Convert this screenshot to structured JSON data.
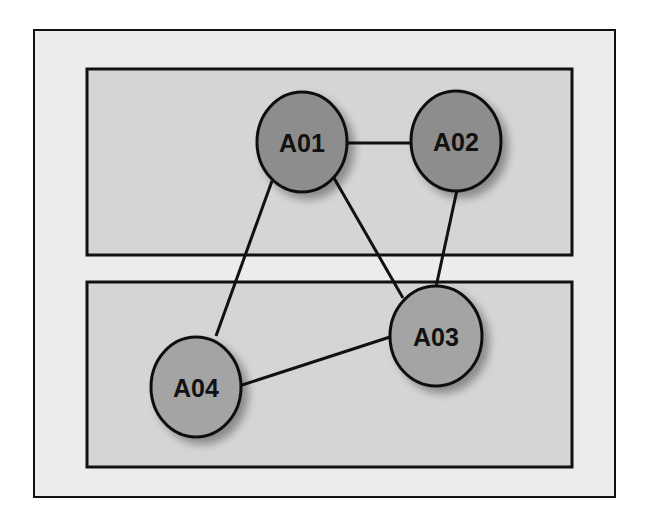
{
  "colors": {
    "page_bg": "#ffffff",
    "outer_box_fill": "#ececec",
    "group_fill": "#d5d5d5",
    "stroke": "#111111",
    "node_dark": "#8d8d8d",
    "node_light": "#a4a4a4"
  },
  "outer_box": {
    "x": 34,
    "y": 30,
    "w": 581,
    "h": 467
  },
  "groups": [
    {
      "id": "top-group",
      "x": 87,
      "y": 69,
      "w": 485,
      "h": 186
    },
    {
      "id": "bottom-group",
      "x": 87,
      "y": 282,
      "w": 485,
      "h": 185
    }
  ],
  "nodes": [
    {
      "id": "A01",
      "label": "A01",
      "cx": 302,
      "cy": 142,
      "rx": 45,
      "ry": 50,
      "fill": "#8d8d8d"
    },
    {
      "id": "A02",
      "label": "A02",
      "cx": 456,
      "cy": 141,
      "rx": 45,
      "ry": 50,
      "fill": "#8d8d8d"
    },
    {
      "id": "A03",
      "label": "A03",
      "cx": 436,
      "cy": 336,
      "rx": 46,
      "ry": 50,
      "fill": "#a4a4a4"
    },
    {
      "id": "A04",
      "label": "A04",
      "cx": 196,
      "cy": 387,
      "rx": 45,
      "ry": 50,
      "fill": "#a4a4a4"
    }
  ],
  "edges": [
    {
      "from": "A01",
      "to": "A02",
      "x1": 347,
      "y1": 143,
      "x2": 411,
      "y2": 143
    },
    {
      "from": "A01",
      "to": "A04",
      "x1": 272,
      "y1": 181,
      "x2": 216,
      "y2": 336
    },
    {
      "from": "A01",
      "to": "A03",
      "x1": 334,
      "y1": 178,
      "x2": 403,
      "y2": 298
    },
    {
      "from": "A02",
      "to": "A03",
      "x1": 457,
      "y1": 190,
      "x2": 436,
      "y2": 287
    },
    {
      "from": "A04",
      "to": "A03",
      "x1": 239,
      "y1": 386,
      "x2": 390,
      "y2": 337
    }
  ]
}
